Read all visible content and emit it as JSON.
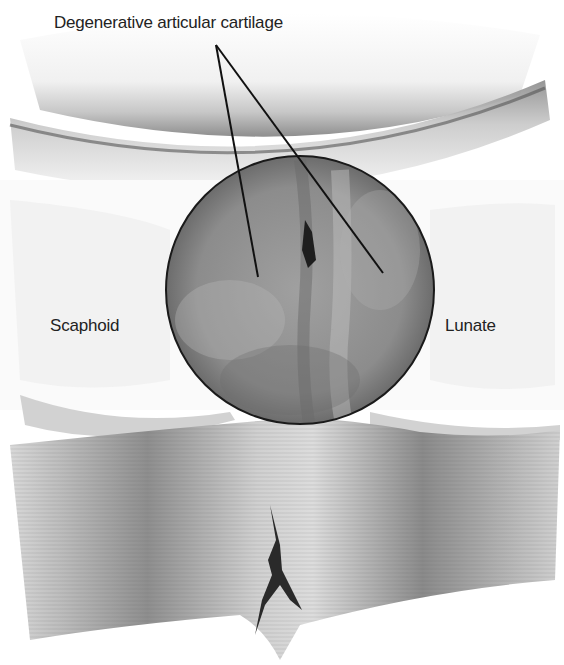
{
  "figure": {
    "labels": {
      "cartilage": "Degenerative articular cartilage",
      "left_bone": "Scaphoid",
      "right_bone": "Lunate"
    },
    "arthroscopic_view": {
      "center": [
        300,
        290
      ],
      "radius": 134
    },
    "colors": {
      "outline": "#1a1a1a",
      "tissue_light": "#e8e8e8",
      "tissue_mid": "#9a9a9a",
      "tissue_dark": "#5a5a5a",
      "scope_fill": "#8a8a8a",
      "tear": "#2a2a2a"
    }
  }
}
